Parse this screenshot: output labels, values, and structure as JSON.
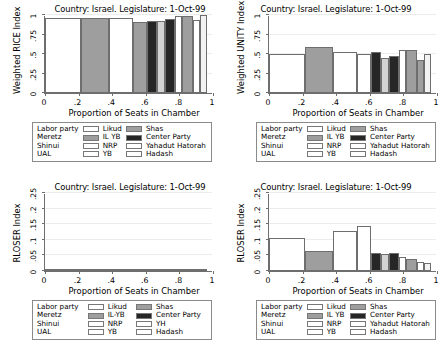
{
  "common": {
    "xlabel": "Proportion of Seats in Chamber",
    "xticks": [
      "0",
      ".2",
      ".4",
      ".6",
      ".8",
      "1"
    ],
    "xtickvals": [
      0,
      0.2,
      0.4,
      0.6,
      0.8,
      1
    ],
    "title": "Country: Israel. Legislature: 1-Oct-99"
  },
  "parties": {
    "labor": {
      "label": "Labor party",
      "color": "#ffffff"
    },
    "meretz": {
      "label": "Meretz",
      "color": "#9e9e9e"
    },
    "shinui": {
      "label": "Shinui",
      "color": "#ffffff"
    },
    "ual": {
      "label": "UAL",
      "color": "#ffffff"
    },
    "likud": {
      "label": "Likud",
      "color": "#9e9e9e"
    },
    "ilyb": {
      "label": "IL YB",
      "color": "#262626"
    },
    "nrp": {
      "label": "NRP",
      "color": "#ffffff"
    },
    "yb": {
      "label": "YB",
      "color": "#ffffff"
    },
    "shas": {
      "label": "Shas",
      "color": "#ffffff"
    },
    "center": {
      "label": "Center Party",
      "color": "#d3d3d3"
    },
    "yahadut": {
      "label": "Yahadut Hatorah",
      "color": "#9e9e9e"
    },
    "hadash": {
      "label": "Hadash",
      "color": "#f2f2f2"
    }
  },
  "legend_tl": {
    "rows": [
      [
        "Labor party",
        "#ffffff",
        "Likud",
        "#9e9e9e",
        "Shas",
        "#ffffff"
      ],
      [
        "Meretz",
        "#9e9e9e",
        "IL YB",
        "#262626",
        "Center Party",
        "#d3d3d3"
      ],
      [
        "Shinui",
        "#ffffff",
        "NRP",
        "#ffffff",
        "Yahadut Hatorah",
        "#9e9e9e"
      ],
      [
        "UAL",
        "#ffffff",
        "YB",
        "#ffffff",
        "Hadash",
        "#f2f2f2"
      ]
    ]
  },
  "legend_tr": {
    "rows": [
      [
        "Labor party",
        "#ffffff",
        "Likud",
        "#9e9e9e",
        "Shas",
        "#ffffff"
      ],
      [
        "Meretz",
        "#9e9e9e",
        "IL YB",
        "#262626",
        "Center Party",
        "#d3d3d3"
      ],
      [
        "Shinui",
        "#ffffff",
        "NRP",
        "#ffffff",
        "Yahadut Hatorah",
        "#9e9e9e"
      ],
      [
        "UAL",
        "#ffffff",
        "YB",
        "#ffffff",
        "Hadash",
        "#f2f2f2"
      ]
    ]
  },
  "legend_bl": {
    "rows": [
      [
        "Labor party",
        "#ffffff",
        "Likud",
        "#9e9e9e",
        "Shas",
        "#ffffff"
      ],
      [
        "Meretz",
        "#9e9e9e",
        "IL-YB",
        "#262626",
        "Center Party",
        "#d3d3d3"
      ],
      [
        "Shinui",
        "#ffffff",
        "NRP",
        "#ffffff",
        "YH",
        "#9e9e9e"
      ],
      [
        "UAL",
        "#ffffff",
        "YB",
        "#ffffff",
        "Hadash",
        "#f2f2f2"
      ]
    ]
  },
  "legend_br": {
    "rows": [
      [
        "Labor party",
        "#ffffff",
        "Likud",
        "#9e9e9e",
        "Shas",
        "#ffffff"
      ],
      [
        "Meretz",
        "#9e9e9e",
        "IL YB",
        "#262626",
        "Center Party",
        "#d3d3d3"
      ],
      [
        "Shinui",
        "#ffffff",
        "NRP",
        "#ffffff",
        "Yahadut Hatorah",
        "#9e9e9e"
      ],
      [
        "UAL",
        "#ffffff",
        "YB",
        "#ffffff",
        "Hadash",
        "#f2f2f2"
      ]
    ]
  },
  "chart_data": [
    {
      "id": "rice",
      "type": "bar",
      "title": "Country: Israel. Legislature: 1-Oct-99",
      "ylabel": "Weighted RICE Index",
      "xlabel": "Proportion of Seats in Chamber",
      "ylim": [
        0,
        1
      ],
      "xlim": [
        0,
        1
      ],
      "yticks": [
        0,
        0.25,
        0.5,
        0.75,
        1
      ],
      "ytick_labels": [
        "0",
        ".25",
        ".5",
        ".75",
        "1"
      ],
      "grid": true,
      "note": "Mosaic/marimekko style: bar width = proportion of seats, height = index value",
      "bars": [
        {
          "party": "Labor party",
          "x0": 0.0,
          "x1": 0.217,
          "value": 0.965,
          "color": "#ffffff"
        },
        {
          "party": "Meretz",
          "x0": 0.217,
          "x1": 0.383,
          "value": 0.965,
          "color": "#9e9e9e"
        },
        {
          "party": "Shinui",
          "x0": 0.383,
          "x1": 0.525,
          "value": 0.965,
          "color": "#ffffff"
        },
        {
          "party": "Likud",
          "x0": 0.525,
          "x1": 0.608,
          "value": 0.905,
          "color": "#9e9e9e"
        },
        {
          "party": "IL YB",
          "x0": 0.608,
          "x1": 0.667,
          "value": 0.925,
          "color": "#262626"
        },
        {
          "party": "Center Party",
          "x0": 0.667,
          "x1": 0.717,
          "value": 0.925,
          "color": "#d3d3d3"
        },
        {
          "party": "Shas",
          "x0": 0.717,
          "x1": 0.775,
          "value": 0.955,
          "color": "#262626"
        },
        {
          "party": "NRP",
          "x0": 0.775,
          "x1": 0.817,
          "value": 0.985,
          "color": "#ffffff"
        },
        {
          "party": "Yahadut Hatorah",
          "x0": 0.817,
          "x1": 0.883,
          "value": 0.985,
          "color": "#9e9e9e"
        },
        {
          "party": "UAL",
          "x0": 0.883,
          "x1": 0.925,
          "value": 0.935,
          "color": "#ffffff"
        },
        {
          "party": "Hadash",
          "x0": 0.925,
          "x1": 0.967,
          "value": 0.995,
          "color": "#f2f2f2"
        }
      ]
    },
    {
      "id": "unity",
      "type": "bar",
      "title": "Country: Israel. Legislature: 1-Oct-99",
      "ylabel": "Weighted UNITY Index",
      "xlabel": "Proportion of Seats in Chamber",
      "ylim": [
        0,
        1
      ],
      "xlim": [
        0,
        1
      ],
      "yticks": [
        0,
        0.25,
        0.5,
        0.75,
        1
      ],
      "ytick_labels": [
        "0",
        ".25",
        ".5",
        ".75",
        "1"
      ],
      "grid": true,
      "bars": [
        {
          "party": "Labor party",
          "x0": 0.0,
          "x1": 0.217,
          "value": 0.495,
          "color": "#ffffff"
        },
        {
          "party": "Meretz",
          "x0": 0.217,
          "x1": 0.383,
          "value": 0.585,
          "color": "#9e9e9e"
        },
        {
          "party": "Shinui",
          "x0": 0.383,
          "x1": 0.525,
          "value": 0.52,
          "color": "#ffffff"
        },
        {
          "party": "Likud",
          "x0": 0.525,
          "x1": 0.608,
          "value": 0.505,
          "color": "#ffffff"
        },
        {
          "party": "IL YB",
          "x0": 0.608,
          "x1": 0.667,
          "value": 0.53,
          "color": "#262626"
        },
        {
          "party": "Center Party",
          "x0": 0.667,
          "x1": 0.717,
          "value": 0.455,
          "color": "#d3d3d3"
        },
        {
          "party": "Shas",
          "x0": 0.717,
          "x1": 0.775,
          "value": 0.48,
          "color": "#262626"
        },
        {
          "party": "NRP",
          "x0": 0.775,
          "x1": 0.817,
          "value": 0.555,
          "color": "#ffffff"
        },
        {
          "party": "Yahadut Hatorah",
          "x0": 0.817,
          "x1": 0.883,
          "value": 0.555,
          "color": "#9e9e9e"
        },
        {
          "party": "UAL",
          "x0": 0.883,
          "x1": 0.925,
          "value": 0.42,
          "color": "#9e9e9e"
        },
        {
          "party": "Hadash",
          "x0": 0.925,
          "x1": 0.967,
          "value": 0.5,
          "color": "#f2f2f2"
        }
      ]
    },
    {
      "id": "rloser_left",
      "type": "bar",
      "title": "Country: Israel. Legislature: 1-Oct-99",
      "ylabel": "RLOSER Index",
      "xlabel": "Proportion of Seats in Chamber",
      "ylim": [
        0,
        0.25
      ],
      "xlim": [
        0,
        1
      ],
      "yticks": [
        0,
        0.05,
        0.1,
        0.15,
        0.2,
        0.25
      ],
      "ytick_labels": [
        "0",
        ".05",
        ".1",
        ".15",
        ".2",
        ".25"
      ],
      "grid": true,
      "bars": [
        {
          "party": "Labor party",
          "x0": 0.0,
          "x1": 0.217,
          "value": 0.0045,
          "color": "#ffffff"
        },
        {
          "party": "Meretz",
          "x0": 0.217,
          "x1": 0.383,
          "value": 0.0022,
          "color": "#9e9e9e"
        },
        {
          "party": "Shinui",
          "x0": 0.383,
          "x1": 0.525,
          "value": 0.0022,
          "color": "#ffffff"
        },
        {
          "party": "Likud",
          "x0": 0.525,
          "x1": 0.608,
          "value": 0.003,
          "color": "#9e9e9e"
        },
        {
          "party": "IL-YB",
          "x0": 0.608,
          "x1": 0.667,
          "value": 0.0035,
          "color": "#262626"
        },
        {
          "party": "Center Party",
          "x0": 0.667,
          "x1": 0.717,
          "value": 0.0022,
          "color": "#d3d3d3"
        },
        {
          "party": "Shas",
          "x0": 0.717,
          "x1": 0.775,
          "value": 0.0035,
          "color": "#262626"
        },
        {
          "party": "NRP",
          "x0": 0.775,
          "x1": 0.817,
          "value": 0.0015,
          "color": "#ffffff"
        },
        {
          "party": "YH",
          "x0": 0.817,
          "x1": 0.883,
          "value": 0.0028,
          "color": "#9e9e9e"
        },
        {
          "party": "UAL",
          "x0": 0.883,
          "x1": 0.925,
          "value": 0.002,
          "color": "#ffffff"
        },
        {
          "party": "Hadash",
          "x0": 0.925,
          "x1": 0.967,
          "value": 0.0018,
          "color": "#f2f2f2"
        }
      ]
    },
    {
      "id": "rloser_right",
      "type": "bar",
      "title": "Country: Israel. Legislature: 1-Oct-99",
      "ylabel": "RLOSER Index",
      "xlabel": "Proportion of Seats in Chamber",
      "ylim": [
        0,
        0.25
      ],
      "xlim": [
        0,
        1
      ],
      "yticks": [
        0,
        0.05,
        0.1,
        0.15,
        0.2,
        0.25
      ],
      "ytick_labels": [
        "0",
        ".05",
        ".1",
        ".15",
        ".2",
        ".25"
      ],
      "grid": true,
      "bars": [
        {
          "party": "Labor party",
          "x0": 0.0,
          "x1": 0.217,
          "value": 0.105,
          "color": "#ffffff"
        },
        {
          "party": "Meretz",
          "x0": 0.217,
          "x1": 0.383,
          "value": 0.065,
          "color": "#9e9e9e"
        },
        {
          "party": "Shinui",
          "x0": 0.383,
          "x1": 0.525,
          "value": 0.127,
          "color": "#ffffff"
        },
        {
          "party": "Likud",
          "x0": 0.525,
          "x1": 0.608,
          "value": 0.143,
          "color": "#ffffff"
        },
        {
          "party": "IL YB",
          "x0": 0.608,
          "x1": 0.667,
          "value": 0.059,
          "color": "#262626"
        },
        {
          "party": "Center Party",
          "x0": 0.667,
          "x1": 0.717,
          "value": 0.055,
          "color": "#d3d3d3"
        },
        {
          "party": "Shas",
          "x0": 0.717,
          "x1": 0.775,
          "value": 0.057,
          "color": "#262626"
        },
        {
          "party": "NRP",
          "x0": 0.775,
          "x1": 0.817,
          "value": 0.044,
          "color": "#ffffff"
        },
        {
          "party": "Yahadut Hatorah",
          "x0": 0.817,
          "x1": 0.883,
          "value": 0.038,
          "color": "#9e9e9e"
        },
        {
          "party": "UAL",
          "x0": 0.883,
          "x1": 0.925,
          "value": 0.029,
          "color": "#ffffff"
        },
        {
          "party": "Hadash",
          "x0": 0.925,
          "x1": 0.967,
          "value": 0.027,
          "color": "#f2f2f2"
        }
      ]
    }
  ]
}
